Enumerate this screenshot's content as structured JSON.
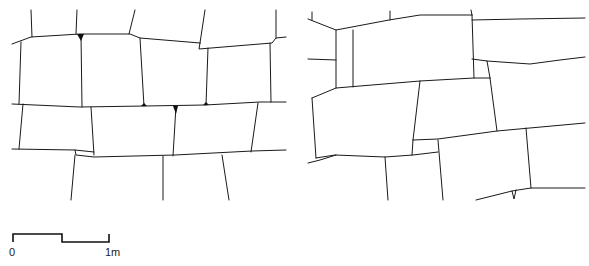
{
  "figure": {
    "type": "masonry-wall-elevation-drawings",
    "panels": [
      {
        "id": "left",
        "description": "stone wall courses with shaped joints and small wedge fillers"
      },
      {
        "id": "right",
        "description": "stone wall courses with irregular blocks and narrow vertical slab"
      }
    ],
    "line_color": "#1a1a1a",
    "background": "#ffffff"
  },
  "scale_bar": {
    "start_label": "0",
    "end_label": "1m",
    "segments": 2
  }
}
